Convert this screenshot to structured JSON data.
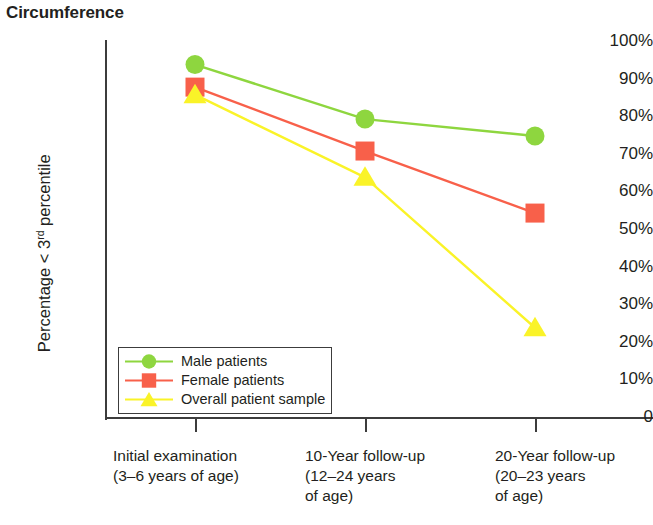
{
  "chart_data": {
    "type": "line",
    "title": "Circumference",
    "xlabel": "",
    "ylabel": "Percentage < 3rd percentile",
    "ylabel_main": "Percentage < 3",
    "ylabel_sup": "rd",
    "ylabel_tail": " percentile",
    "ylim": [
      0,
      100
    ],
    "grid": false,
    "legend_position": "inside-bottom-left",
    "categories": [
      "Initial examination\n(3–6 years of age)",
      "10-Year follow-up\n(12–24 years\nof age)",
      "20-Year follow-up\n(20–23 years\nof age)"
    ],
    "ytick_labels": [
      "100%",
      "90%",
      "80%",
      "70%",
      "60%",
      "50%",
      "40%",
      "30%",
      "20%",
      "10%",
      "0"
    ],
    "ytick_values": [
      100,
      90,
      80,
      70,
      60,
      50,
      40,
      30,
      20,
      10,
      0
    ],
    "series": [
      {
        "name": "Male patients",
        "color": "#8ed63f",
        "marker": "circle",
        "values": [
          94,
          79.5,
          75
        ]
      },
      {
        "name": "Female patients",
        "color": "#f8604a",
        "marker": "square",
        "values": [
          88,
          71,
          54.5
        ]
      },
      {
        "name": "Overall patient sample",
        "color": "#faf328",
        "marker": "triangle",
        "values": [
          86,
          64,
          24
        ]
      }
    ]
  },
  "legend": {
    "items": [
      {
        "label": "Male patients",
        "marker": "circle-marker-icon",
        "color": "#8ed63f"
      },
      {
        "label": "Female patients",
        "marker": "square-marker-icon",
        "color": "#f8604a"
      },
      {
        "label": "Overall patient sample",
        "marker": "triangle-marker-icon",
        "color": "#faf328"
      }
    ]
  },
  "axis": {
    "line_color": "#3c3c3c"
  }
}
